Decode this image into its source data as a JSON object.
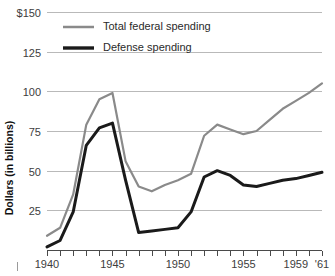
{
  "chart_data": {
    "type": "line",
    "title": "",
    "xlabel": "",
    "ylabel": "Dollars (in billions)",
    "xlim": [
      1940,
      1961
    ],
    "ylim": [
      0,
      150
    ],
    "grid": true,
    "legend_position": "top-left-inside",
    "x": [
      1940,
      1941,
      1942,
      1943,
      1944,
      1945,
      1946,
      1947,
      1948,
      1949,
      1950,
      1951,
      1952,
      1953,
      1954,
      1955,
      1956,
      1957,
      1958,
      1959,
      1960,
      1961
    ],
    "x_tick_values": [
      1940,
      1945,
      1950,
      1955,
      1959,
      1961
    ],
    "x_tick_labels": [
      "1940",
      "1945",
      "1950",
      "1955",
      "1959",
      "'61"
    ],
    "y_tick_values": [
      25,
      50,
      75,
      100,
      125,
      150
    ],
    "y_tick_labels": [
      "25",
      "50",
      "75",
      "100",
      "125",
      "$150"
    ],
    "series": [
      {
        "name": "Total federal spending",
        "color": "#8a8a8a",
        "width": 2.2,
        "values": [
          9,
          14,
          35,
          79,
          95,
          99,
          56,
          40,
          37,
          41,
          44,
          48,
          72,
          79,
          76,
          73,
          75,
          82,
          89,
          94,
          99,
          105
        ]
      },
      {
        "name": "Defense spending",
        "color": "#1a1a1a",
        "width": 3.0,
        "values": [
          2,
          6,
          24,
          66,
          77,
          80,
          44,
          11,
          12,
          13,
          14,
          24,
          46,
          50,
          47,
          41,
          40,
          42,
          44,
          45,
          47,
          49
        ]
      }
    ]
  },
  "legend": {
    "items": [
      {
        "label": "Total federal spending",
        "color": "#8a8a8a",
        "width": 2.5
      },
      {
        "label": "Defense spending",
        "color": "#1a1a1a",
        "width": 3.4
      }
    ]
  },
  "axis": {
    "y_title": "Dollars (in billions)"
  }
}
